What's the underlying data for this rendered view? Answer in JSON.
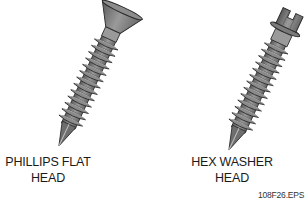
{
  "figure": {
    "items": [
      {
        "name": "phillips-flat-head-screw",
        "label_lines": [
          "PHILLIPS FLAT",
          "HEAD"
        ]
      },
      {
        "name": "hex-washer-head-screw",
        "label_lines": [
          "HEX WASHER",
          "HEAD"
        ]
      }
    ],
    "figure_code": "108F26.EPS",
    "colors": {
      "body": "#7a7a7a",
      "dark": "#3a3a3a",
      "light": "#a8a8a8",
      "outline": "#2a2a2a"
    }
  }
}
